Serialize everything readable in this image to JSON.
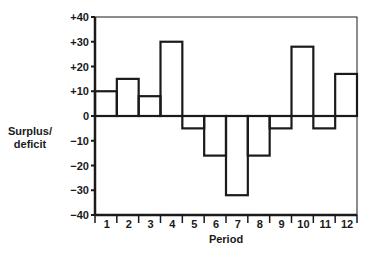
{
  "chart_data": {
    "type": "bar",
    "title": "",
    "xlabel": "Period",
    "ylabel": "Surplus/\ndeficit",
    "ylabel_lines": [
      "Surplus/",
      "deficit"
    ],
    "categories": [
      "1",
      "2",
      "3",
      "4",
      "5",
      "6",
      "7",
      "8",
      "9",
      "10",
      "11",
      "12"
    ],
    "values": [
      10,
      15,
      8,
      30,
      -5,
      -16,
      -32,
      -16,
      -5,
      28,
      -5,
      17
    ],
    "ylim": [
      -40,
      40
    ],
    "yticks": [
      40,
      30,
      20,
      10,
      0,
      -10,
      -20,
      -30,
      -40
    ],
    "ytick_labels": [
      "+40",
      "+30",
      "+20",
      "+10",
      "0",
      "−10",
      "−20",
      "−30",
      "−40"
    ],
    "grid": false,
    "legend": null,
    "bar_style": "outlined, no fill, adjacent bars (histogram style)"
  },
  "colors": {
    "stroke": "#1a1a1a",
    "background": "#ffffff"
  }
}
